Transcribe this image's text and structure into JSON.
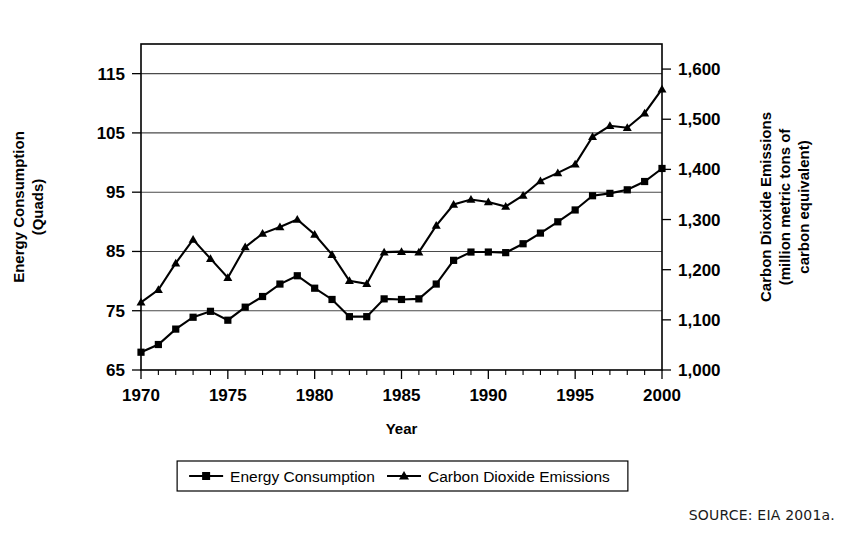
{
  "figure": {
    "source_note": "SOURCE: EIA 2001a."
  },
  "chart_data": {
    "type": "line",
    "title": "",
    "xlabel": "Year",
    "ylabel": "Energy Consumption (Quads)",
    "y2label": "Carbon Dioxide Emissions (million metric tons of carbon equivalent)",
    "ylabel_lines": [
      "Energy Consumption",
      "(Quads)"
    ],
    "y2label_lines": [
      "Carbon Dioxide Emissions",
      "(million metric tons of",
      "carbon equivalent)"
    ],
    "grid": true,
    "legend_position": "bottom",
    "xlim": [
      1970,
      2000
    ],
    "xticks": [
      1970,
      1975,
      1980,
      1985,
      1990,
      1995,
      2000
    ],
    "xticklabels": [
      "1970",
      "1975",
      "1980",
      "1985",
      "1990",
      "1995",
      "2000"
    ],
    "x_minor_interval": 1,
    "ylim": [
      65,
      120
    ],
    "yticks": [
      65,
      75,
      85,
      95,
      105,
      115
    ],
    "yticklabels": [
      "65",
      "75",
      "85",
      "95",
      "105",
      "115"
    ],
    "y2lim": [
      1000,
      1650
    ],
    "y2ticks": [
      1000,
      1100,
      1200,
      1300,
      1400,
      1500,
      1600
    ],
    "y2ticklabels": [
      "1,000",
      "1,100",
      "1,200",
      "1,300",
      "1,400",
      "1,500",
      "1,600"
    ],
    "x": [
      1970,
      1971,
      1972,
      1973,
      1974,
      1975,
      1976,
      1977,
      1978,
      1979,
      1980,
      1981,
      1982,
      1983,
      1984,
      1985,
      1986,
      1987,
      1988,
      1989,
      1990,
      1991,
      1992,
      1993,
      1994,
      1995,
      1996,
      1997,
      1998,
      1999,
      2000
    ],
    "series": [
      {
        "name": "Energy Consumption",
        "axis": "left",
        "unit": "Quads",
        "marker": "square",
        "values": [
          68.0,
          69.3,
          71.9,
          73.9,
          74.9,
          73.4,
          75.6,
          77.4,
          79.5,
          80.9,
          78.8,
          76.9,
          74.0,
          74.0,
          77.0,
          76.9,
          77.0,
          79.5,
          83.5,
          84.9,
          84.9,
          84.8,
          86.3,
          88.1,
          90.0,
          92.0,
          94.4,
          94.8,
          95.4,
          96.8,
          99.0
        ]
      },
      {
        "name": "Carbon Dioxide Emissions",
        "axis": "right",
        "unit": "million metric tons of carbon equivalent",
        "marker": "triangle",
        "values": [
          1135,
          1160,
          1213,
          1260,
          1222,
          1184,
          1245,
          1272,
          1285,
          1300,
          1270,
          1230,
          1178,
          1172,
          1235,
          1236,
          1235,
          1288,
          1330,
          1340,
          1335,
          1326,
          1348,
          1377,
          1393,
          1410,
          1465,
          1487,
          1483,
          1512,
          1560
        ]
      }
    ]
  },
  "legend": {
    "items": [
      {
        "label": "Energy Consumption",
        "marker": "square"
      },
      {
        "label": "Carbon Dioxide Emissions",
        "marker": "triangle"
      }
    ]
  }
}
